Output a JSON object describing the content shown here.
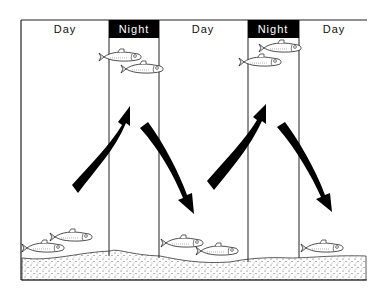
{
  "periods": [
    {
      "label": "Day",
      "type": "day"
    },
    {
      "label": "Night",
      "type": "night"
    },
    {
      "label": "Day",
      "type": "day"
    },
    {
      "label": "Night",
      "type": "night"
    },
    {
      "label": "Day",
      "type": "day"
    }
  ],
  "arrows": [
    {
      "direction": "up",
      "meaning": "ascent at dusk"
    },
    {
      "direction": "down",
      "meaning": "descent at dawn"
    },
    {
      "direction": "up",
      "meaning": "ascent at dusk"
    },
    {
      "direction": "down",
      "meaning": "descent at dawn"
    }
  ],
  "fish_groups": [
    {
      "position": "bottom",
      "period_index": 0,
      "count": 2
    },
    {
      "position": "surface",
      "period_index": 1,
      "count": 2
    },
    {
      "position": "bottom",
      "period_index": 2,
      "count": 2
    },
    {
      "position": "surface",
      "period_index": 3,
      "count": 2
    },
    {
      "position": "bottom",
      "period_index": 4,
      "count": 1
    }
  ],
  "colors": {
    "ink": "#111111",
    "night_header": "#000000",
    "night_text": "#ffffff"
  }
}
